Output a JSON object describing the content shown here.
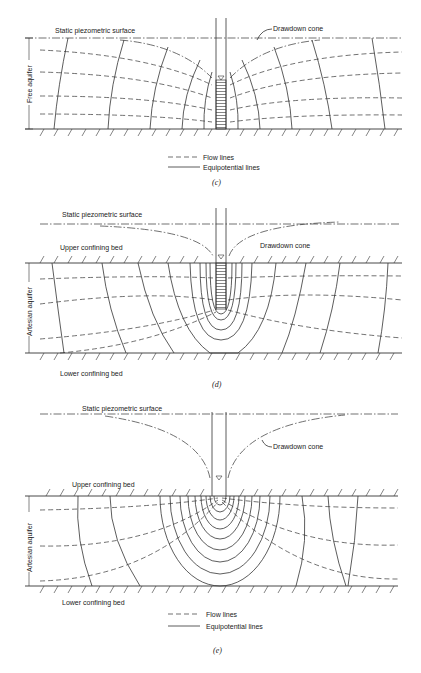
{
  "panels": [
    {
      "id": "c",
      "caption": "(c)",
      "labels": {
        "static_surface": "Static piezometric surface",
        "drawdown_cone": "Drawdown cone",
        "aquifer": "Free aquifer"
      },
      "legend": {
        "flow_lines": "Flow lines",
        "equipotential_lines": "Equipotential lines"
      }
    },
    {
      "id": "d",
      "caption": "(d)",
      "labels": {
        "static_surface": "Static piezometric surface",
        "drawdown_cone": "Drawdown cone",
        "upper_bed": "Upper confining bed",
        "lower_bed": "Lower confining bed",
        "aquifer": "Artesian aquifer"
      }
    },
    {
      "id": "e",
      "caption": "(e)",
      "labels": {
        "static_surface": "Static piezometric surface",
        "drawdown_cone": "Drawdown cone",
        "upper_bed": "Upper confining bed",
        "lower_bed": "Lower confining bed",
        "aquifer": "Artesian aquifer"
      },
      "legend": {
        "flow_lines": "Flow lines",
        "equipotential_lines": "Equipotential lines"
      }
    }
  ]
}
